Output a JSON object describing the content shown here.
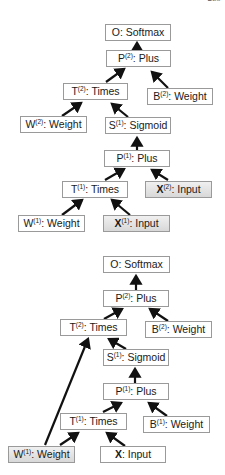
{
  "page_number": "289",
  "diagrams": [
    {
      "name": "unrolled-network-top",
      "nodes": {
        "o_softmax": {
          "sym": "O",
          "sup": "",
          "label": ": Softmax",
          "shaded": false
        },
        "p2_plus": {
          "sym": "P",
          "sup": "(2)",
          "label": ": Plus",
          "shaded": false
        },
        "t2_times": {
          "sym": "T",
          "sup": "(2)",
          "label": ": Times",
          "shaded": false
        },
        "b2_weight": {
          "sym": "B",
          "sup": "(2)",
          "label": ": Weight",
          "shaded": false
        },
        "w2_weight": {
          "sym": "W",
          "sup": "(2)",
          "label": ": Weight",
          "shaded": false
        },
        "s1_sigmoid": {
          "sym": "S",
          "sup": "(1)",
          "label": ": Sigmoid",
          "shaded": false
        },
        "p1_plus": {
          "sym": "P",
          "sup": "(1)",
          "label": ": Plus",
          "shaded": false
        },
        "t1_times": {
          "sym": "T",
          "sup": "(1)",
          "label": ": Times",
          "shaded": false
        },
        "x2_input": {
          "sym": "X",
          "sup": "(2)",
          "label": ": Input",
          "shaded": true
        },
        "w1_weight": {
          "sym": "W",
          "sup": "(1)",
          "label": ": Weight",
          "shaded": false
        },
        "x1_input": {
          "sym": "X",
          "sup": "(1)",
          "label": ": Input",
          "shaded": true
        }
      }
    },
    {
      "name": "unrolled-network-bottom",
      "nodes": {
        "o_softmax": {
          "sym": "O",
          "sup": "",
          "label": ": Softmax",
          "shaded": false
        },
        "p2_plus": {
          "sym": "P",
          "sup": "(2)",
          "label": ": Plus",
          "shaded": false
        },
        "t2_times": {
          "sym": "T",
          "sup": "(2)",
          "label": ": Times",
          "shaded": false
        },
        "b2_weight": {
          "sym": "B",
          "sup": "(2)",
          "label": ": Weight",
          "shaded": false
        },
        "s1_sigmoid": {
          "sym": "S",
          "sup": "(1)",
          "label": ": Sigmoid",
          "shaded": false
        },
        "p1_plus": {
          "sym": "P",
          "sup": "(1)",
          "label": ": Plus",
          "shaded": false
        },
        "t1_times": {
          "sym": "T",
          "sup": "(1)",
          "label": ": Times",
          "shaded": false
        },
        "b1_weight": {
          "sym": "B",
          "sup": "(1)",
          "label": ": Weight",
          "shaded": false
        },
        "w1_weight": {
          "sym": "W",
          "sup": "(1)",
          "label": ": Weight",
          "shaded": true
        },
        "x_input": {
          "sym": "X",
          "sup": "",
          "label": ": Input",
          "shaded": false
        }
      }
    }
  ],
  "colors": {
    "border": "#9a9a9a",
    "arrow": "#111111",
    "shade": "#e0e0e0"
  }
}
